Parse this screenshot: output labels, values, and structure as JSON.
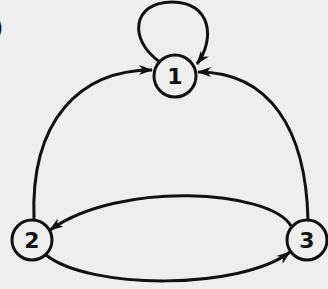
{
  "diagram": {
    "type": "state-transition-graph",
    "panel_label": ")",
    "colors": {
      "background": "#eeeeee",
      "stroke": "#111111"
    },
    "nodes": [
      {
        "id": "1",
        "label": "1",
        "cx": 175,
        "cy": 76,
        "r": 21
      },
      {
        "id": "2",
        "label": "2",
        "cx": 32,
        "cy": 240,
        "r": 20
      },
      {
        "id": "3",
        "label": "3",
        "cx": 307,
        "cy": 240,
        "r": 20
      }
    ],
    "edges": [
      {
        "from": "1",
        "to": "1",
        "kind": "self-loop"
      },
      {
        "from": "2",
        "to": "1",
        "kind": "arc"
      },
      {
        "from": "3",
        "to": "1",
        "kind": "arc"
      },
      {
        "from": "3",
        "to": "2",
        "kind": "arc-upper"
      },
      {
        "from": "2",
        "to": "3",
        "kind": "arc-lower"
      }
    ]
  }
}
